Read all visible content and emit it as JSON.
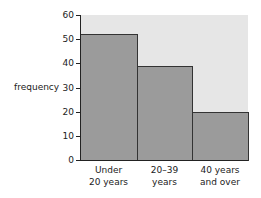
{
  "chart_data": {
    "type": "bar",
    "title": "",
    "xlabel": "",
    "ylabel": "frequency",
    "categories": [
      "Under 20 years",
      "20–39 years",
      "40 years and over"
    ],
    "category_lines": [
      [
        "Under",
        "20 years"
      ],
      [
        "20–39",
        "years"
      ],
      [
        "40 years",
        "and over"
      ]
    ],
    "values": [
      52,
      39,
      20
    ],
    "ylim": [
      0,
      60
    ],
    "yticks": [
      0,
      10,
      20,
      30,
      40,
      50,
      60
    ],
    "grid": false,
    "legend": null,
    "colors": {
      "bar": "#9b9b9b",
      "plot_background": "#e6e6e6",
      "edge": "#333333"
    }
  }
}
